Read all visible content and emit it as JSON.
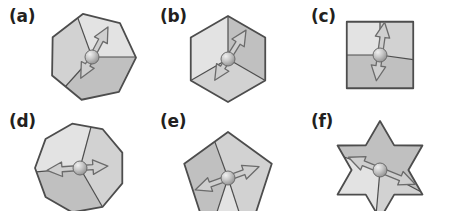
{
  "figure": {
    "title": "",
    "background_color": "#ffffff",
    "panel_count": 6,
    "columns": 3,
    "rows": 2
  },
  "palette": {
    "outline": "#4d4d4d",
    "fill_light": "#e3e3e3",
    "fill_mid": "#d2d2d2",
    "fill_dark": "#c0c0c0",
    "fill_darker": "#b4b4b4",
    "arrow_fill": "#cfcfcf",
    "arrow_outline": "#6b6b6b",
    "ball_light": "#f0f0f0",
    "ball_mid": "#c9c9c9",
    "ball_dark": "#8f8f8f",
    "label_color": "#231f20"
  },
  "panels": [
    {
      "id": "a",
      "label": "(a)",
      "shape_name": "heptagon",
      "sides": 7,
      "shape_rotation_deg": -12,
      "sector_lines_deg": [
        0,
        132,
        250
      ],
      "sector_fills": [
        "fill_dark",
        "fill_mid",
        "fill_light"
      ],
      "center": {
        "x": 92,
        "y": 57
      },
      "radius": 44,
      "ball_radius": 7,
      "arrow": {
        "angle_deg": -62,
        "style": "double-ended-outline",
        "head_length": 15,
        "shaft_width": 5,
        "length_forward": 34,
        "length_back": 24,
        "tail_head": true
      }
    },
    {
      "id": "b",
      "label": "(b)",
      "shape_name": "hexagon",
      "sides": 6,
      "shape_rotation_deg": 0,
      "sector_lines_deg": [
        -90,
        150,
        30
      ],
      "sector_fills": [
        "fill_dark",
        "fill_mid",
        "fill_light"
      ],
      "center": {
        "x": 228,
        "y": 59
      },
      "radius": 43,
      "ball_radius": 7,
      "arrow": {
        "angle_deg": -58,
        "style": "double-ended-outline",
        "head_length": 15,
        "shaft_width": 5,
        "length_forward": 34,
        "length_back": 25,
        "tail_head": true
      }
    },
    {
      "id": "c",
      "label": "(c)",
      "shape_name": "square-diamond",
      "sides": 4,
      "shape_rotation_deg": 45,
      "sector_lines_deg": [
        -90,
        180,
        8
      ],
      "sector_fills": [
        "fill_mid",
        "fill_dark",
        "fill_light"
      ],
      "center": {
        "x": 380,
        "y": 55
      },
      "radius": 47,
      "ball_radius": 7,
      "arrow": {
        "angle_deg": -82,
        "style": "double-ended-outline",
        "head_length": 15,
        "shaft_width": 5,
        "length_forward": 33,
        "length_back": 26,
        "tail_head": true
      }
    },
    {
      "id": "d",
      "label": "(d)",
      "shape_name": "nonagon",
      "sides": 9,
      "shape_rotation_deg": -10,
      "sector_lines_deg": [
        60,
        175,
        285
      ],
      "sector_fills": [
        "fill_dark",
        "fill_light",
        "fill_mid"
      ],
      "center": {
        "x": 80,
        "y": 168
      },
      "radius": 45,
      "ball_radius": 7,
      "arrow": {
        "angle_deg": 176,
        "style": "double-ended-outline",
        "head_length": 15,
        "shaft_width": 5,
        "length_forward": 33,
        "length_back": 28,
        "tail_head": true
      }
    },
    {
      "id": "e",
      "label": "(e)",
      "shape_name": "pentagon",
      "sides": 5,
      "shape_rotation_deg": 0,
      "sector_lines_deg": [
        108,
        72,
        250
      ],
      "sector_fills": [
        "fill_light",
        "fill_dark",
        "fill_mid"
      ],
      "center": {
        "x": 228,
        "y": 178
      },
      "radius": 46,
      "ball_radius": 7,
      "arrow": {
        "angle_deg": 160,
        "style": "double-ended-outline",
        "head_length": 16,
        "shaft_width": 5,
        "length_forward": 35,
        "length_back": 33,
        "tail_head": true
      }
    },
    {
      "id": "f",
      "label": "(f)",
      "shape_name": "six-pointed-star",
      "points": 6,
      "shape_rotation_deg": 0,
      "inner_radius_ratio": 0.58,
      "sector_lines_deg": [
        200,
        28,
        95
      ],
      "sector_fills": [
        "fill_mid",
        "fill_light",
        "fill_dark"
      ],
      "center": {
        "x": 380,
        "y": 170
      },
      "radius": 49,
      "ball_radius": 7,
      "arrow": {
        "angle_deg": 22,
        "style": "double-ended-outline",
        "head_length": 16,
        "shaft_width": 5,
        "length_forward": 38,
        "length_back": 34,
        "tail_head": true
      }
    }
  ]
}
